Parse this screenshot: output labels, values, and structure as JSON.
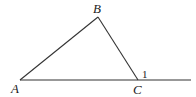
{
  "diagram": {
    "type": "geometry-triangle",
    "points": {
      "A": {
        "label": "A",
        "x": 20,
        "y": 80
      },
      "B": {
        "label": "B",
        "x": 98,
        "y": 17
      },
      "C": {
        "label": "C",
        "x": 138,
        "y": 80
      }
    },
    "extension_end": {
      "x": 191,
      "y": 80
    },
    "angle_label": "1",
    "stroke_color": "#333333"
  }
}
